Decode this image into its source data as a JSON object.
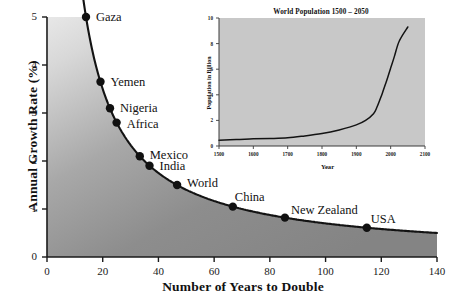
{
  "chart_data": [
    {
      "type": "line",
      "id": "main",
      "title": "",
      "xlabel": "Number of Years to Double",
      "ylabel": "Annual Growth Rate (%)",
      "xlim": [
        0,
        140
      ],
      "ylim": [
        0,
        5
      ],
      "xticks": [
        0,
        20,
        40,
        60,
        80,
        100,
        120,
        140
      ],
      "yticks": [
        0,
        1,
        2,
        3,
        4,
        5
      ],
      "grid": false,
      "legend": "none",
      "fill": "gray-gradient-below-curve",
      "curve_formula": "growth_rate = 70 / years_to_double",
      "points": [
        {
          "label": "Gaza",
          "x": 14.0,
          "y": 5.0
        },
        {
          "label": "Yemen",
          "x": 19.2,
          "y": 3.65
        },
        {
          "label": "Nigeria",
          "x": 22.6,
          "y": 3.1
        },
        {
          "label": "Africa",
          "x": 25.0,
          "y": 2.8
        },
        {
          "label": "Mexico",
          "x": 33.3,
          "y": 2.1
        },
        {
          "label": "India",
          "x": 36.8,
          "y": 1.9
        },
        {
          "label": "World",
          "x": 46.7,
          "y": 1.5
        },
        {
          "label": "China",
          "x": 66.7,
          "y": 1.05
        },
        {
          "label": "New Zealand",
          "x": 85.4,
          "y": 0.82
        },
        {
          "label": "USA",
          "x": 114.8,
          "y": 0.61
        }
      ]
    },
    {
      "type": "line",
      "id": "inset",
      "title": "World Population 1500 – 2050",
      "xlabel": "Year",
      "ylabel": "Population in Billion",
      "xlim": [
        1500,
        2100
      ],
      "ylim": [
        0,
        10
      ],
      "xticks": [
        1500,
        1600,
        1700,
        1800,
        1900,
        2000,
        2100
      ],
      "yticks": [
        0,
        2,
        4,
        6,
        8,
        10
      ],
      "grid": false,
      "legend": "none",
      "panel_color": "#c8c8c8",
      "x": [
        1500,
        1550,
        1600,
        1650,
        1700,
        1750,
        1800,
        1850,
        1900,
        1927,
        1950,
        1960,
        1975,
        1987,
        1999,
        2011,
        2025,
        2050
      ],
      "values": [
        0.45,
        0.5,
        0.56,
        0.58,
        0.64,
        0.79,
        0.98,
        1.26,
        1.65,
        2.0,
        2.52,
        3.02,
        4.07,
        5.0,
        6.0,
        7.0,
        8.2,
        9.3
      ]
    }
  ],
  "main": {
    "ylabel": "Annual Growth Rate (%)",
    "xlabel": "Number of Years to Double",
    "yticks": [
      "5",
      "4",
      "3",
      "2",
      "1",
      "0"
    ],
    "xticks": [
      "0",
      "20",
      "40",
      "60",
      "80",
      "100",
      "120",
      "140"
    ],
    "point_labels": {
      "gaza": "Gaza",
      "yemen": "Yemen",
      "nigeria": "Nigeria",
      "africa": "Africa",
      "mexico": "Mexico",
      "india": "India",
      "world": "World",
      "china": "China",
      "new_zealand": "New Zealand",
      "usa": "USA"
    }
  },
  "inset": {
    "title": "World Population 1500 – 2050",
    "ylabel": "Population in Billion",
    "xlabel": "Year",
    "yticks": [
      "10",
      "8",
      "6",
      "4",
      "2",
      "0"
    ],
    "xticks": [
      "1500",
      "1600",
      "1700",
      "1800",
      "1900",
      "2000",
      "2100"
    ]
  },
  "colors": {
    "axis": "#1a1a1a",
    "curve": "#111111",
    "fill_dark": "#8a8a8a",
    "fill_light": "#f2f2f2",
    "inset_panel": "#c8c8c8",
    "background": "#ffffff"
  }
}
